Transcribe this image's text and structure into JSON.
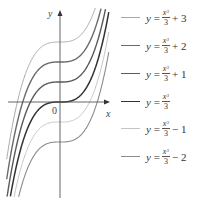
{
  "chart_data": {
    "type": "line",
    "title": "",
    "xlabel": "x",
    "ylabel": "y",
    "origin_label": "0",
    "grid": false,
    "legend_position": "right",
    "xlim": [
      -2.5,
      2.4
    ],
    "ylim": [
      -4.6,
      4.5
    ],
    "x": [
      -2.0,
      -1.5,
      -1.0,
      -0.5,
      0.0,
      0.5,
      1.0,
      1.5,
      2.0
    ],
    "series": [
      {
        "name": "y = x^3/3 + 3",
        "label_main": "y =",
        "numerator": "x",
        "power": "3",
        "denominator": "3",
        "suffix": "+ 3",
        "shift": 3,
        "color": "#a8a8a8",
        "width": 1.0,
        "values": [
          0.333,
          1.875,
          2.667,
          2.958,
          3.0,
          3.042,
          3.333,
          4.125,
          5.667
        ]
      },
      {
        "name": "y = x^3/3 + 2",
        "label_main": "y =",
        "numerator": "x",
        "power": "3",
        "denominator": "3",
        "suffix": "+ 2",
        "shift": 2,
        "color": "#6a6a6a",
        "width": 1.4,
        "values": [
          -0.667,
          0.875,
          1.667,
          1.958,
          2.0,
          2.042,
          2.333,
          3.125,
          4.667
        ]
      },
      {
        "name": "y = x^3/3 + 1",
        "label_main": "y =",
        "numerator": "x",
        "power": "3",
        "denominator": "3",
        "suffix": "+ 1",
        "shift": 1,
        "color": "#5a5a5a",
        "width": 1.4,
        "values": [
          -1.667,
          -0.125,
          0.667,
          0.958,
          1.0,
          1.042,
          1.333,
          2.125,
          3.667
        ]
      },
      {
        "name": "y = x^3/3",
        "label_main": "y =",
        "numerator": "x",
        "power": "3",
        "denominator": "3",
        "suffix": "",
        "shift": 0,
        "color": "#333333",
        "width": 1.5,
        "values": [
          -2.667,
          -1.125,
          -0.333,
          -0.042,
          0.0,
          0.042,
          0.333,
          1.125,
          2.667
        ]
      },
      {
        "name": "y = x^3/3 - 1",
        "label_main": "y =",
        "numerator": "x",
        "power": "3",
        "denominator": "3",
        "suffix": "− 1",
        "shift": -1,
        "color": "#c4c4c4",
        "width": 1.0,
        "values": [
          -3.667,
          -2.125,
          -1.333,
          -1.042,
          -1.0,
          -0.958,
          -0.667,
          0.125,
          1.667
        ]
      },
      {
        "name": "y = x^3/3 - 2",
        "label_main": "y =",
        "numerator": "x",
        "power": "3",
        "denominator": "3",
        "suffix": "− 2",
        "shift": -2,
        "color": "#8c8c8c",
        "width": 1.1,
        "values": [
          -4.667,
          -3.125,
          -2.333,
          -2.042,
          -2.0,
          -1.958,
          -1.667,
          -0.875,
          0.667
        ]
      }
    ]
  },
  "axes": {
    "x_label": "x",
    "y_label": "y",
    "origin_label": "0",
    "axis_color": "#555555"
  }
}
